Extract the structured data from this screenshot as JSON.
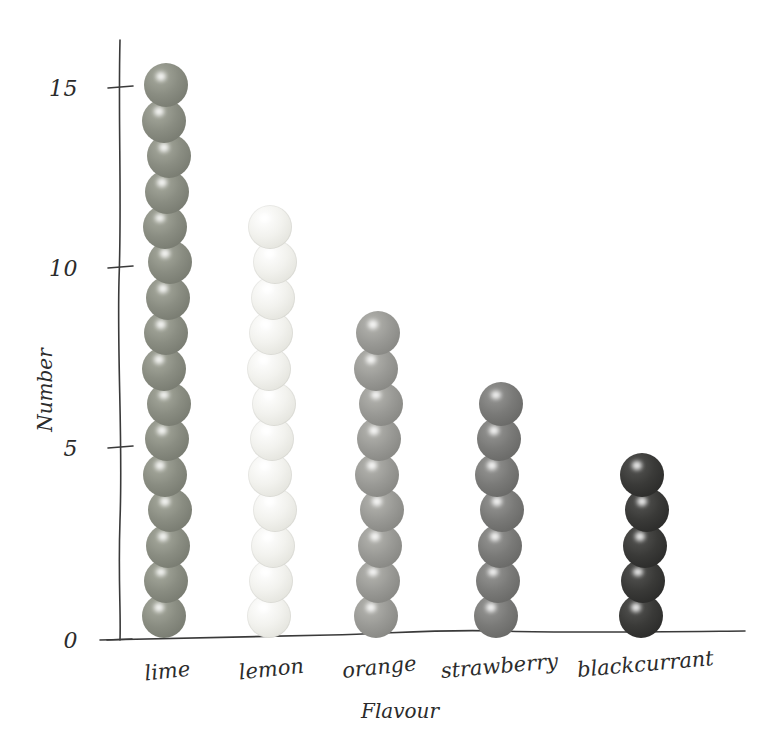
{
  "chart_data": {
    "type": "bar",
    "subtype": "dot-plot-pictogram",
    "title": "",
    "xlabel": "Flavour",
    "ylabel": "Number",
    "categories": [
      "lime",
      "lemon",
      "orange",
      "strawberry",
      "blackcurrant"
    ],
    "values": [
      16,
      12,
      9,
      7,
      5
    ],
    "ylim": [
      0,
      16
    ],
    "yticks": [
      0,
      5,
      10,
      15
    ],
    "ytick_labels": [
      "0",
      "5",
      "10",
      "15"
    ],
    "grid": false,
    "legend": "none",
    "style": "hand-drawn",
    "series": [
      {
        "name": "Number",
        "values": [
          16,
          12,
          9,
          7,
          5
        ]
      }
    ],
    "point_colors": {
      "lime": "#8a8d82",
      "lemon": "#f2f2ee",
      "orange": "#9a9a96",
      "strawberry": "#7a7a78",
      "blackcurrant": "#3a3a38"
    }
  },
  "axes": {
    "y_title": "Number",
    "x_title": "Flavour",
    "y_tick_0": "0",
    "y_tick_5": "5",
    "y_tick_10": "10",
    "y_tick_15": "15"
  },
  "categories": [
    {
      "label": "lime",
      "count": 16,
      "color": "#8a8d82",
      "shade_dark": "#6e7167",
      "shade_light": "#a8ab9f"
    },
    {
      "label": "lemon",
      "count": 12,
      "color": "#f2f2ee",
      "shade_dark": "#dcdcd4",
      "shade_light": "#ffffff"
    },
    {
      "label": "orange",
      "count": 9,
      "color": "#9a9a96",
      "shade_dark": "#7d7d79",
      "shade_light": "#b6b6b1"
    },
    {
      "label": "strawberry",
      "count": 7,
      "color": "#7a7a78",
      "shade_dark": "#5f5f5d",
      "shade_light": "#989896"
    },
    {
      "label": "blackcurrant",
      "count": 5,
      "color": "#3a3a38",
      "shade_dark": "#232322",
      "shade_light": "#565654"
    }
  ],
  "colors": {
    "background": "#ffffff",
    "ink": "#2b2b2b",
    "axis": "#3a3a3a"
  }
}
